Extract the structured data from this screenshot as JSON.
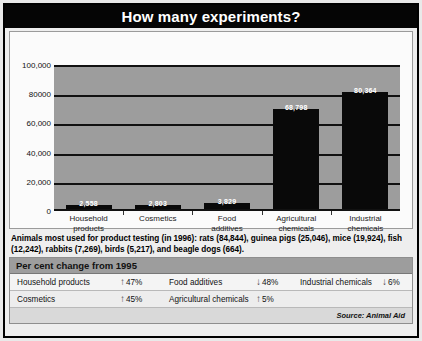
{
  "title": "How many experiments?",
  "note": "Animals most used for product testing (in 1996): rats (84,844), guinea pigs (25,046), mice (19,924), fish (12,242), rabbits (7,269), birds (5,217), and beagle dogs (664).",
  "source": "Source: Animal Aid",
  "percent_table": {
    "header": "Per cent change from 1995",
    "rows": [
      [
        {
          "label": "Household products",
          "arrow": "↑",
          "direction": "up",
          "value": "47%"
        },
        {
          "label": "Food additives",
          "arrow": "↓",
          "direction": "down",
          "value": "48%"
        },
        {
          "label": "Industrial chemicals",
          "arrow": "↓",
          "direction": "down",
          "value": "6%"
        }
      ],
      [
        {
          "label": "Cosmetics",
          "arrow": "↑",
          "direction": "up",
          "value": "45%"
        },
        {
          "label": "Agricultural chemicals",
          "arrow": "↑",
          "direction": "up",
          "value": "5%"
        },
        {
          "label": "",
          "arrow": "",
          "direction": "",
          "value": ""
        }
      ]
    ]
  },
  "chart_data": {
    "type": "bar",
    "title": "How many experiments?",
    "xlabel": "",
    "ylabel": "",
    "ylim": [
      0,
      100000
    ],
    "grid": true,
    "legend": "none",
    "categories": [
      "Household products",
      "Cosmetics",
      "Food additives",
      "Agricultural chemicals",
      "Industrial chemicals"
    ],
    "category_lines": [
      [
        "Household",
        "products"
      ],
      [
        "Cosmetics",
        ""
      ],
      [
        "Food",
        "additives"
      ],
      [
        "Agricultural",
        "chemicals"
      ],
      [
        "Industrial",
        "chemicals"
      ]
    ],
    "values": [
      2558,
      2803,
      3829,
      68798,
      80364
    ],
    "value_labels": [
      "2,558",
      "2,803",
      "3,829",
      "68,798",
      "80,364"
    ],
    "ytick_values": [
      0,
      20000,
      40000,
      60000,
      80000,
      100000
    ],
    "ytick_labels": [
      "0",
      "20,000",
      "40,000",
      "60,000",
      "80000",
      "100,000"
    ],
    "colors": {
      "bar": "#090909",
      "plot_background": "#9d9d9d",
      "gridline": "#111111",
      "value_label": "#ffffff"
    }
  }
}
